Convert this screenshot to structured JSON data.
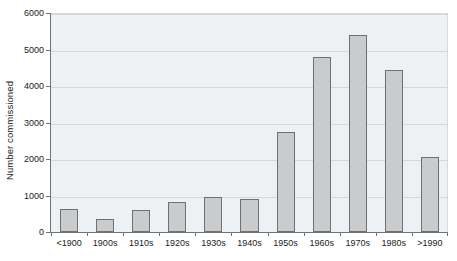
{
  "chart_data": {
    "type": "bar",
    "title": "",
    "subtitle": "",
    "xlabel": "",
    "ylabel": "Number commissioned",
    "categories": [
      "<1900",
      "1900s",
      "1910s",
      "1920s",
      "1930s",
      "1940s",
      "1950s",
      "1960s",
      "1970s",
      "1980s",
      ">1990"
    ],
    "values": [
      640,
      360,
      600,
      810,
      950,
      910,
      2740,
      4790,
      5400,
      4430,
      2060
    ],
    "ylim": [
      0,
      6000
    ],
    "y_ticks": [
      0,
      1000,
      2000,
      3000,
      4000,
      5000,
      6000
    ],
    "y_tick_labels": [
      "0",
      "1000",
      "2000",
      "3000",
      "4000",
      "5000",
      "6000"
    ],
    "grid": true,
    "grid_axis": "y",
    "legend": false,
    "legend_position": "none",
    "annotations": []
  },
  "style": {
    "bar_fill": "#c9cbcc",
    "bar_stroke": "#6d7173",
    "plot_background": "#eef1f4",
    "grid_color": "#d3d8dc",
    "axis_color": "#6f7374",
    "text_color": "#1b1b1b",
    "page_background": "#ffffff"
  }
}
